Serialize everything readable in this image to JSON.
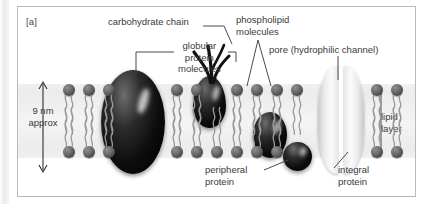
{
  "figure": {
    "panel_label": "[a]"
  },
  "labels": {
    "carbohydrate_chain": "carbohydrate chain",
    "globular_protein_molecules_line1": "globular",
    "globular_protein_molecules_line2": "protein",
    "globular_protein_molecules_line3": "molecules",
    "phospholipid_molecules_line1": "phospholipid",
    "phospholipid_molecules_line2": "molecules",
    "pore": "pore (hydrophilic channel)",
    "thickness_line1": "9 nm",
    "thickness_line2": "approx",
    "lipid_layer_line1": "lipid",
    "lipid_layer_line2": "layer",
    "peripheral_protein_line1": "peripheral",
    "peripheral_protein_line2": "protein",
    "integral_protein_line1": "integral",
    "integral_protein_line2": "protein"
  },
  "structures": {
    "phospholipid_top_count": 14,
    "phospholipid_bottom_count": 14,
    "globular_proteins": 4,
    "pore_count": 1
  },
  "colors": {
    "protein_dark": "#0c0c0c",
    "phospholipid_head": "#4a4a4a",
    "membrane_band": "#f0f0f0",
    "pore_light": "#e2e2e2",
    "text": "#3a3a3a",
    "frame": "#b9b9b9"
  }
}
